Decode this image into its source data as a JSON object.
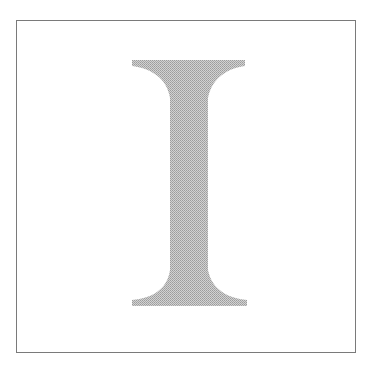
{
  "figure": {
    "glyph": "I",
    "colors": {
      "frame": "#7a7a7a",
      "glyph_fill": "#bdbdbd",
      "glyph_dither": "#9a9a9a",
      "background": "#ffffff"
    }
  }
}
